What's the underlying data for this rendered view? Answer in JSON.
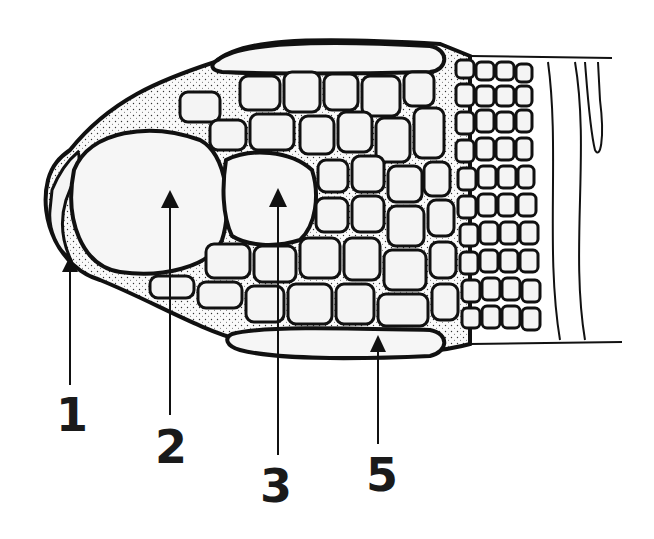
{
  "figure": {
    "labels": [
      {
        "id": "1",
        "text": "1",
        "x": 56,
        "y": 392,
        "arrow_tip": [
          70,
          258
        ]
      },
      {
        "id": "2",
        "text": "2",
        "x": 155,
        "y": 424,
        "arrow_tip": [
          170,
          193
        ]
      },
      {
        "id": "3",
        "text": "3",
        "x": 260,
        "y": 463,
        "arrow_tip": [
          279,
          188
        ]
      },
      {
        "id": "5",
        "text": "5",
        "x": 368,
        "y": 453,
        "arrow_tip": [
          378,
          337
        ]
      }
    ],
    "colors": {
      "ink": "#111111",
      "paper": "#ffffff",
      "stipple": "#f4f4f4"
    }
  }
}
